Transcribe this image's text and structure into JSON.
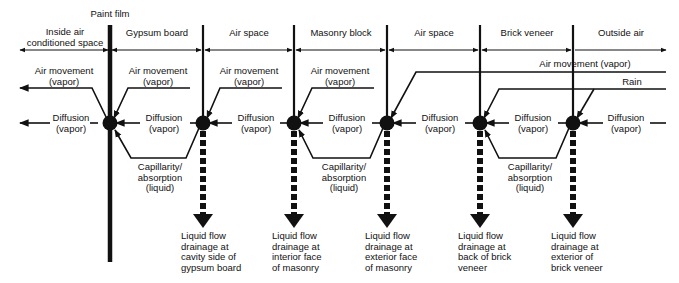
{
  "title_label": "Paint film",
  "zones": [
    {
      "label_line1": "Inside air",
      "label_line2": "conditioned space"
    },
    {
      "label_line1": "Gypsum board",
      "label_line2": ""
    },
    {
      "label_line1": "Air space",
      "label_line2": ""
    },
    {
      "label_line1": "Masonry block",
      "label_line2": ""
    },
    {
      "label_line1": "Air space",
      "label_line2": ""
    },
    {
      "label_line1": "Brick veneer",
      "label_line2": ""
    },
    {
      "label_line1": "Outside air",
      "label_line2": ""
    }
  ],
  "air_movement": {
    "short_line1": "Air movement",
    "short_line2": "(vapor)",
    "long_label": "Air movement (vapor)"
  },
  "rain_label": "Rain",
  "diffusion": {
    "line1": "Diffusion",
    "line2": "(vapor)"
  },
  "capillarity": {
    "line1": "Capillarity/",
    "line2": "absorption",
    "line3": "(liquid)"
  },
  "drainage": [
    {
      "line1": "Liquid flow",
      "line2": "drainage at",
      "line3": "cavity side of",
      "line4": "gypsum board"
    },
    {
      "line1": "Liquid flow",
      "line2": "drainage at",
      "line3": "interior face",
      "line4": "of masonry"
    },
    {
      "line1": "Liquid flow",
      "line2": "drainage at",
      "line3": "exterior face",
      "line4": "of masonry"
    },
    {
      "line1": "Liquid flow",
      "line2": "drainage at",
      "line3": "back of brick",
      "line4": "veneer"
    },
    {
      "line1": "Liquid flow",
      "line2": "drainage at",
      "line3": "exterior of",
      "line4": "brick veneer"
    }
  ],
  "colors": {
    "ink": "#111111",
    "background": "#ffffff"
  }
}
